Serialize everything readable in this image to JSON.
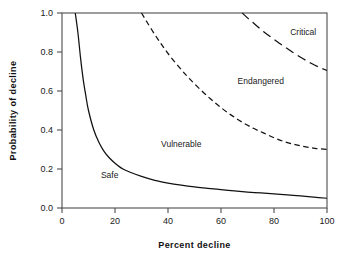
{
  "chart_data": {
    "type": "line",
    "title": "",
    "xlabel": "Percent  decline",
    "ylabel": "Probability  of  decline",
    "xlim": [
      0,
      100
    ],
    "ylim": [
      0.0,
      1.0
    ],
    "grid": false,
    "legend_position": "none",
    "xticks": [
      "0",
      "20",
      "40",
      "60",
      "80",
      "100"
    ],
    "xtick_values": [
      0,
      20,
      40,
      60,
      80,
      100
    ],
    "yticks": [
      "0.0",
      "0.2",
      "0.4",
      "0.6",
      "0.8",
      "1.0"
    ],
    "ytick_values": [
      0.0,
      0.2,
      0.4,
      0.6,
      0.8,
      1.0
    ],
    "annotations": [
      {
        "text": "Safe",
        "x": 18,
        "y": 0.155
      },
      {
        "text": "Vulnerable",
        "x": 45,
        "y": 0.315
      },
      {
        "text": "Endangered",
        "x": 75,
        "y": 0.635
      },
      {
        "text": "Critical",
        "x": 91,
        "y": 0.885
      }
    ],
    "series": [
      {
        "name": "Safe / Vulnerable boundary",
        "style": "solid",
        "color": "#111111",
        "x": [
          5,
          6,
          7,
          8,
          9,
          10,
          12,
          14,
          16,
          18,
          20,
          23,
          26,
          30,
          35,
          40,
          45,
          50,
          55,
          60,
          65,
          70,
          75,
          80,
          85,
          90,
          95,
          100
        ],
        "y": [
          1.0,
          0.9,
          0.77,
          0.66,
          0.575,
          0.5,
          0.4,
          0.335,
          0.288,
          0.255,
          0.23,
          0.2,
          0.182,
          0.162,
          0.142,
          0.128,
          0.117,
          0.108,
          0.101,
          0.094,
          0.088,
          0.082,
          0.077,
          0.072,
          0.067,
          0.062,
          0.056,
          0.05
        ]
      },
      {
        "name": "Vulnerable / Endangered boundary",
        "style": "dashed",
        "color": "#111111",
        "x": [
          30,
          32,
          35,
          38,
          41,
          45,
          48,
          52,
          56,
          60,
          64,
          68,
          72,
          76,
          80,
          84,
          88,
          92,
          96,
          100
        ],
        "y": [
          1.0,
          0.955,
          0.89,
          0.83,
          0.775,
          0.71,
          0.665,
          0.61,
          0.56,
          0.515,
          0.475,
          0.44,
          0.41,
          0.385,
          0.36,
          0.34,
          0.325,
          0.313,
          0.305,
          0.3
        ]
      },
      {
        "name": "Endangered / Critical boundary",
        "style": "longdash",
        "color": "#111111",
        "x": [
          68,
          70,
          73,
          76,
          79,
          82,
          85,
          88,
          91,
          94,
          97,
          100
        ],
        "y": [
          1.0,
          0.975,
          0.94,
          0.905,
          0.875,
          0.845,
          0.818,
          0.79,
          0.765,
          0.742,
          0.722,
          0.705
        ]
      }
    ]
  },
  "figure": {
    "background_color": "#ffffff",
    "axis_color": "#4d4d4d",
    "curve_color": "#111111"
  }
}
